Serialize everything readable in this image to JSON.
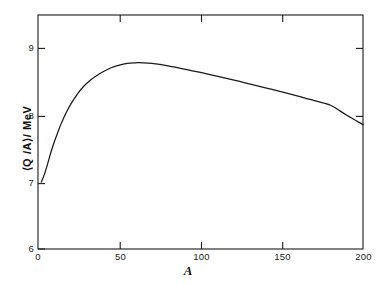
{
  "chart_data": {
    "type": "line",
    "title": "",
    "subtitle": "",
    "xlabel": "A",
    "ylabel": "⟨Q /A⟩/ MeV",
    "xlim": [
      0,
      200
    ],
    "ylim": [
      6,
      9.4
    ],
    "grid": false,
    "legend": null,
    "annotations": [],
    "xticks": [
      {
        "value": 0,
        "label": "0"
      },
      {
        "value": 50,
        "label": "50"
      },
      {
        "value": 100,
        "label": "100"
      },
      {
        "value": 150,
        "label": "150"
      },
      {
        "value": 200,
        "label": "200"
      }
    ],
    "yticks": [
      {
        "value": 6,
        "label": "6"
      },
      {
        "value": 7,
        "label": "7"
      },
      {
        "value": 8,
        "label": "8"
      },
      {
        "value": 9,
        "label": "9"
      }
    ],
    "series": [
      {
        "name": "binding-energy-per-nucleon",
        "color": "#1a1a1a",
        "x": [
          2,
          4,
          6,
          8,
          10,
          12,
          14,
          16,
          18,
          20,
          24,
          28,
          32,
          36,
          40,
          45,
          50,
          55,
          60,
          62,
          65,
          70,
          75,
          80,
          85,
          90,
          95,
          100,
          110,
          120,
          130,
          140,
          150,
          160,
          170,
          180,
          190,
          200
        ],
        "y": [
          7.0,
          7.12,
          7.28,
          7.45,
          7.6,
          7.73,
          7.86,
          7.97,
          8.07,
          8.16,
          8.31,
          8.43,
          8.52,
          8.59,
          8.65,
          8.71,
          8.75,
          8.775,
          8.785,
          8.786,
          8.784,
          8.775,
          8.76,
          8.74,
          8.715,
          8.69,
          8.665,
          8.64,
          8.585,
          8.53,
          8.47,
          8.41,
          8.35,
          8.285,
          8.22,
          8.15,
          8.0,
          7.86
        ]
      }
    ]
  },
  "axis": {
    "frame_color": "#1a1a1a"
  }
}
